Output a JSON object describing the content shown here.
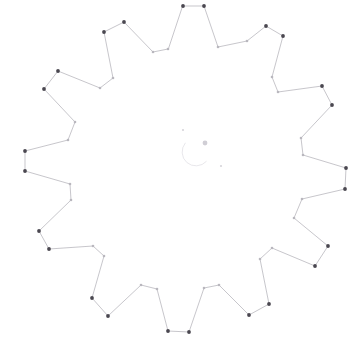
{
  "figure": {
    "title": "",
    "background_color": "#ffffff",
    "width": 361,
    "height": 360,
    "line_color": "#bdbcc2",
    "outer_marker_color": "#4a4750",
    "inner_marker_color": "#b9b7be"
  },
  "chart_data": {
    "type": "line",
    "title": "",
    "subtitle": "",
    "xlabel": "",
    "ylabel": "",
    "xlim": [
      0,
      361
    ],
    "ylim": [
      0,
      360
    ],
    "grid": false,
    "legend": null,
    "axes_visible": false,
    "tick_labels_x": [],
    "tick_labels_y": [],
    "center": [
      186,
      168
    ],
    "teeth": 14,
    "outer_radius": 162,
    "inner_radius": 108,
    "series": [
      {
        "name": "gear-outline",
        "closed": true,
        "points": [
          [
            183,
            6
          ],
          [
            204,
            6
          ],
          [
            226,
            46
          ],
          [
            257,
            52
          ],
          [
            248,
            27
          ],
          [
            278,
            74
          ],
          [
            283,
            34
          ],
          [
            298,
            92
          ],
          [
            322,
            54
          ],
          [
            324,
            119
          ],
          [
            347,
            89
          ],
          [
            338,
            150
          ],
          [
            358,
            130
          ],
          [
            346,
            174
          ],
          [
            353,
            171
          ],
          [
            333,
            205
          ],
          [
            344,
            214
          ],
          [
            312,
            230
          ],
          [
            327,
            254
          ],
          [
            287,
            251
          ],
          [
            298,
            288
          ],
          [
            255,
            264
          ],
          [
            261,
            304
          ],
          [
            218,
            272
          ],
          [
            216,
            319
          ],
          [
            180,
            272
          ],
          [
            170,
            333
          ],
          [
            148,
            283
          ],
          [
            127,
            330
          ],
          [
            114,
            282
          ],
          [
            96,
            311
          ],
          [
            95,
            259
          ],
          [
            65,
            282
          ],
          [
            81,
            248
          ],
          [
            46,
            254
          ],
          [
            74,
            218
          ],
          [
            38,
            215
          ],
          [
            72,
            190
          ],
          [
            25,
            171
          ],
          [
            72,
            163
          ],
          [
            25,
            151
          ],
          [
            74,
            140
          ],
          [
            38,
            119
          ],
          [
            81,
            117
          ],
          [
            46,
            88
          ],
          [
            96,
            106
          ],
          [
            65,
            60
          ],
          [
            114,
            91
          ],
          [
            95,
            39
          ],
          [
            128,
            80
          ],
          [
            127,
            17
          ],
          [
            148,
            66
          ],
          [
            170,
            6
          ],
          [
            180,
            62
          ]
        ],
        "vertices": [
          {
            "index": 0,
            "x": 183,
            "y": 6,
            "kind": "outer"
          },
          {
            "index": 1,
            "x": 204,
            "y": 6,
            "kind": "outer"
          },
          {
            "index": 2,
            "x": 218,
            "y": 47,
            "kind": "inner"
          },
          {
            "index": 3,
            "x": 247,
            "y": 41,
            "kind": "inner"
          },
          {
            "index": 4,
            "x": 266,
            "y": 26,
            "kind": "outer"
          },
          {
            "index": 5,
            "x": 283,
            "y": 36,
            "kind": "outer"
          },
          {
            "index": 6,
            "x": 272,
            "y": 77,
            "kind": "inner"
          },
          {
            "index": 7,
            "x": 278,
            "y": 92,
            "kind": "inner"
          },
          {
            "index": 8,
            "x": 322,
            "y": 86,
            "kind": "outer"
          },
          {
            "index": 9,
            "x": 332,
            "y": 105,
            "kind": "outer"
          },
          {
            "index": 10,
            "x": 301,
            "y": 138,
            "kind": "inner"
          },
          {
            "index": 11,
            "x": 303,
            "y": 155,
            "kind": "inner"
          },
          {
            "index": 12,
            "x": 346,
            "y": 168,
            "kind": "outer"
          },
          {
            "index": 13,
            "x": 345,
            "y": 189,
            "kind": "outer"
          },
          {
            "index": 14,
            "x": 302,
            "y": 199,
            "kind": "inner"
          },
          {
            "index": 15,
            "x": 294,
            "y": 218,
            "kind": "inner"
          },
          {
            "index": 16,
            "x": 328,
            "y": 246,
            "kind": "outer"
          },
          {
            "index": 17,
            "x": 315,
            "y": 266,
            "kind": "outer"
          },
          {
            "index": 18,
            "x": 272,
            "y": 248,
            "kind": "inner"
          },
          {
            "index": 19,
            "x": 260,
            "y": 259,
            "kind": "inner"
          },
          {
            "index": 20,
            "x": 269,
            "y": 304,
            "kind": "outer"
          },
          {
            "index": 21,
            "x": 249,
            "y": 315,
            "kind": "outer"
          },
          {
            "index": 22,
            "x": 219,
            "y": 285,
            "kind": "inner"
          },
          {
            "index": 23,
            "x": 204,
            "y": 288,
            "kind": "inner"
          },
          {
            "index": 24,
            "x": 189,
            "y": 332,
            "kind": "outer"
          },
          {
            "index": 25,
            "x": 168,
            "y": 331,
            "kind": "outer"
          },
          {
            "index": 26,
            "x": 157,
            "y": 289,
            "kind": "inner"
          },
          {
            "index": 27,
            "x": 141,
            "y": 285,
            "kind": "inner"
          },
          {
            "index": 28,
            "x": 108,
            "y": 316,
            "kind": "outer"
          },
          {
            "index": 29,
            "x": 92,
            "y": 298,
            "kind": "outer"
          },
          {
            "index": 30,
            "x": 104,
            "y": 256,
            "kind": "inner"
          },
          {
            "index": 31,
            "x": 93,
            "y": 246,
            "kind": "inner"
          },
          {
            "index": 32,
            "x": 49,
            "y": 249,
            "kind": "outer"
          },
          {
            "index": 33,
            "x": 39,
            "y": 231,
            "kind": "outer"
          },
          {
            "index": 34,
            "x": 71,
            "y": 200,
            "kind": "inner"
          },
          {
            "index": 35,
            "x": 70,
            "y": 184,
            "kind": "inner"
          },
          {
            "index": 36,
            "x": 25,
            "y": 171,
            "kind": "outer"
          },
          {
            "index": 37,
            "x": 25,
            "y": 151,
            "kind": "outer"
          },
          {
            "index": 38,
            "x": 68,
            "y": 140,
            "kind": "inner"
          },
          {
            "index": 39,
            "x": 75,
            "y": 122,
            "kind": "inner"
          },
          {
            "index": 40,
            "x": 44,
            "y": 89,
            "kind": "outer"
          },
          {
            "index": 41,
            "x": 58,
            "y": 71,
            "kind": "outer"
          },
          {
            "index": 42,
            "x": 100,
            "y": 88,
            "kind": "inner"
          },
          {
            "index": 43,
            "x": 113,
            "y": 78,
            "kind": "inner"
          },
          {
            "index": 44,
            "x": 104,
            "y": 32,
            "kind": "outer"
          },
          {
            "index": 45,
            "x": 124,
            "y": 22,
            "kind": "outer"
          },
          {
            "index": 46,
            "x": 153,
            "y": 52,
            "kind": "inner"
          },
          {
            "index": 47,
            "x": 168,
            "y": 49,
            "kind": "inner"
          }
        ]
      }
    ],
    "center_artifacts": [
      {
        "name": "speck-upper-left",
        "x": 183,
        "y": 130,
        "r": 1.1,
        "color": "#d6d5da"
      },
      {
        "name": "speck-lower-right",
        "x": 221,
        "y": 166,
        "r": 1.1,
        "color": "#d6d5da"
      },
      {
        "name": "center-blob",
        "x": 205,
        "y": 143,
        "r": 2.4,
        "color": "#d0ced5"
      },
      {
        "name": "faint-arc",
        "x": 196,
        "y": 152,
        "r": 14,
        "color": "#e2e1e6"
      }
    ]
  }
}
